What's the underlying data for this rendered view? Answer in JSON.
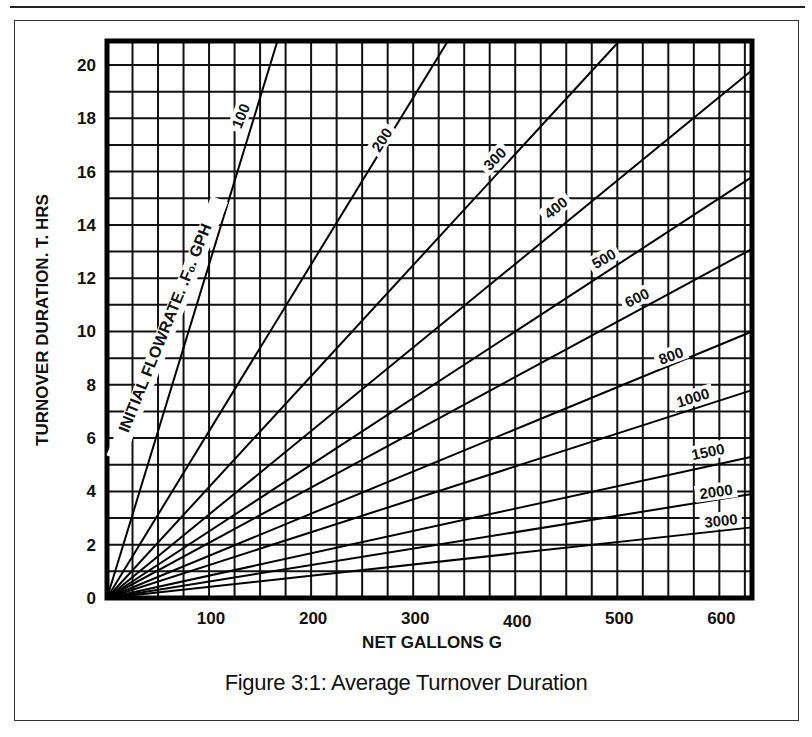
{
  "caption": "Figure 3:1:  Average Turnover Duration",
  "chart_data": {
    "type": "line",
    "title": "Figure 3:1: Average Turnover Duration",
    "xlabel": "NET GALLONS G",
    "ylabel": "TURNOVER DURATION. T. HRS",
    "series_group_label": "INITIAL FLOWRATE. .F₀. GPH",
    "xlim": [
      0,
      632
    ],
    "ylim": [
      0,
      20.9
    ],
    "x_ticks": [
      100,
      200,
      300,
      400,
      500,
      600
    ],
    "y_ticks": [
      0,
      2,
      4,
      6,
      8,
      10,
      12,
      14,
      16,
      18,
      20
    ],
    "x_grid_step": 25,
    "y_grid_step": 1,
    "grid": true,
    "relationship": "T ≈ 12.5 × G / F",
    "series": [
      {
        "name": "100",
        "points": [
          [
            0,
            0
          ],
          [
            167,
            20.9
          ]
        ]
      },
      {
        "name": "200",
        "points": [
          [
            0,
            0
          ],
          [
            334,
            20.9
          ]
        ]
      },
      {
        "name": "300",
        "points": [
          [
            0,
            0
          ],
          [
            502,
            20.9
          ]
        ]
      },
      {
        "name": "400",
        "points": [
          [
            0,
            0
          ],
          [
            632,
            19.8
          ]
        ]
      },
      {
        "name": "500",
        "points": [
          [
            0,
            0
          ],
          [
            632,
            15.8
          ]
        ]
      },
      {
        "name": "600",
        "points": [
          [
            0,
            0
          ],
          [
            632,
            13.1
          ]
        ]
      },
      {
        "name": "800",
        "points": [
          [
            0,
            0
          ],
          [
            632,
            10.0
          ]
        ]
      },
      {
        "name": "1000",
        "points": [
          [
            0,
            0
          ],
          [
            632,
            7.8
          ]
        ]
      },
      {
        "name": "1500",
        "points": [
          [
            0,
            0
          ],
          [
            632,
            5.3
          ]
        ]
      },
      {
        "name": "2000",
        "points": [
          [
            0,
            0
          ],
          [
            632,
            3.9
          ]
        ]
      },
      {
        "name": "3000",
        "points": [
          [
            0,
            0
          ],
          [
            632,
            2.65
          ]
        ]
      }
    ],
    "line_labels": [
      {
        "text": "100",
        "x": 241,
        "y": 116,
        "angle": -68
      },
      {
        "text": "200",
        "x": 382,
        "y": 140,
        "angle": -57
      },
      {
        "text": "300",
        "x": 495,
        "y": 159,
        "angle": -45
      },
      {
        "text": "400",
        "x": 556,
        "y": 208,
        "angle": -38
      },
      {
        "text": "500",
        "x": 604,
        "y": 259,
        "angle": -30
      },
      {
        "text": "600",
        "x": 637,
        "y": 298,
        "angle": -26
      },
      {
        "text": "800",
        "x": 671,
        "y": 356,
        "angle": -20
      },
      {
        "text": "1000",
        "x": 693,
        "y": 398,
        "angle": -17
      },
      {
        "text": "1500",
        "x": 708,
        "y": 452,
        "angle": -12
      },
      {
        "text": "2000",
        "x": 716,
        "y": 492,
        "angle": -8
      },
      {
        "text": "3000",
        "x": 721,
        "y": 521,
        "angle": -6
      }
    ]
  }
}
